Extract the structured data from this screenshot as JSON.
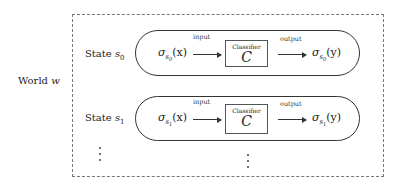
{
  "world": {
    "label": "World",
    "var": "w"
  },
  "states": [
    {
      "label": "State",
      "var": "s",
      "sub": "0",
      "input_label": "input",
      "input_expr": {
        "sigma": "σ",
        "sub": "s",
        "subsub": "0",
        "arg": "(x)"
      },
      "classifier": {
        "title": "Classifier",
        "var": "C"
      },
      "output_label": "output",
      "output_expr": {
        "sigma": "σ",
        "sub": "s",
        "subsub": "0",
        "arg": "(y)"
      }
    },
    {
      "label": "State",
      "var": "s",
      "sub": "1",
      "input_label": "input",
      "input_expr": {
        "sigma": "σ",
        "sub": "s",
        "subsub": "1",
        "arg": "(x)"
      },
      "classifier": {
        "title": "Classifier",
        "var": "C"
      },
      "output_label": "output",
      "output_expr": {
        "sigma": "σ",
        "sub": "s",
        "subsub": "1",
        "arg": "(y)"
      }
    }
  ],
  "ellipsis": "⋮"
}
